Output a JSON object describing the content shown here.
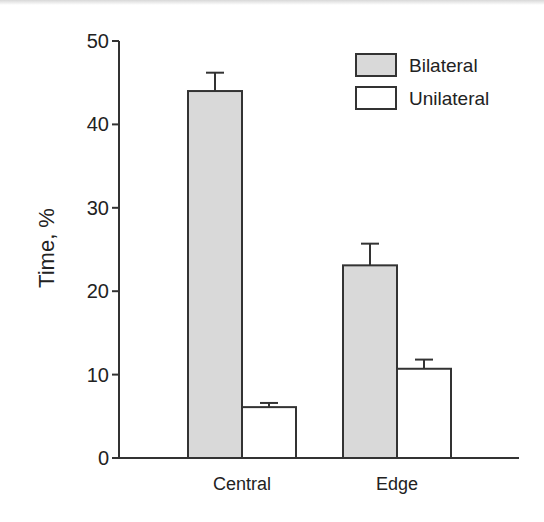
{
  "chart_data": {
    "type": "bar",
    "title": "",
    "xlabel": "",
    "ylabel": "Time, %",
    "ylim": [
      0,
      50
    ],
    "yticks": [
      0,
      10,
      20,
      30,
      40,
      50
    ],
    "ytick_labels": [
      "0",
      "10",
      "20",
      "30",
      "40",
      "50"
    ],
    "categories": [
      "Central",
      "Edge"
    ],
    "series": [
      {
        "name": "Bilateral",
        "values": [
          44.0,
          23.1
        ],
        "errors": [
          2.2,
          2.6
        ],
        "color": "#d9d9d9"
      },
      {
        "name": "Unilateral",
        "values": [
          6.1,
          10.7
        ],
        "errors": [
          0.5,
          1.1
        ],
        "color": "#ffffff"
      }
    ],
    "legend": {
      "position": "top-right",
      "entries": [
        "Bilateral",
        "Unilateral"
      ]
    },
    "grid": false
  }
}
